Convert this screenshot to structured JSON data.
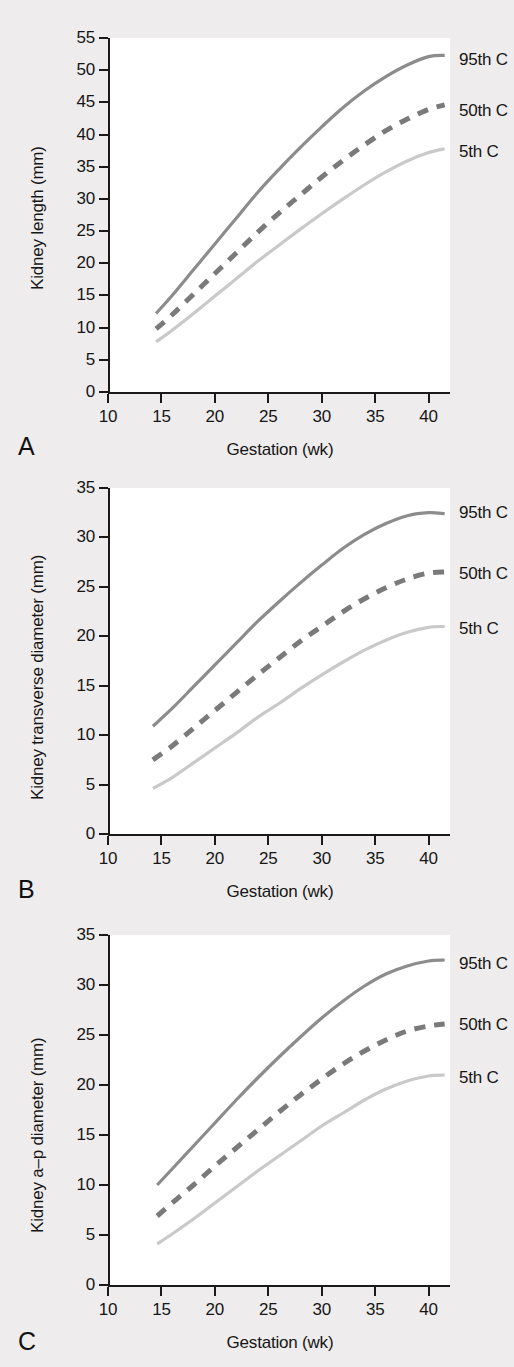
{
  "figure": {
    "background_color": "#eeecec",
    "plot_background_color": "#ffffff",
    "axis_color": "#1a1a1a"
  },
  "series_colors": {
    "p95": "#8c8c8c",
    "p50": "#7a7a7a",
    "p5": "#c9c9c9"
  },
  "legend": {
    "p95": "95th C",
    "p50": "50th C",
    "p5": "5th C"
  },
  "panels": [
    {
      "letter": "A",
      "ylabel": "Kidney length (mm)",
      "xlabel": "Gestation (wk)",
      "yticks": [
        "0",
        "5",
        "10",
        "15",
        "20",
        "25",
        "30",
        "35",
        "40",
        "45",
        "50",
        "55"
      ],
      "xticks": [
        "10",
        "15",
        "20",
        "25",
        "30",
        "35",
        "40"
      ]
    },
    {
      "letter": "B",
      "ylabel": "Kidney transverse diameter (mm)",
      "xlabel": "Gestation (wk)",
      "yticks": [
        "0",
        "5",
        "10",
        "15",
        "20",
        "25",
        "30",
        "35"
      ],
      "xticks": [
        "10",
        "15",
        "20",
        "25",
        "30",
        "35",
        "40"
      ]
    },
    {
      "letter": "C",
      "ylabel": "Kidney a–p diameter (mm)",
      "xlabel": "Gestation (wk)",
      "yticks": [
        "0",
        "5",
        "10",
        "15",
        "20",
        "25",
        "30",
        "35"
      ],
      "xticks": [
        "10",
        "15",
        "20",
        "25",
        "30",
        "35",
        "40"
      ]
    }
  ],
  "chart_data": [
    {
      "type": "line",
      "title": "",
      "panel": "A",
      "xlabel": "Gestation (wk)",
      "ylabel": "Kidney length (mm)",
      "xlim": [
        10,
        42
      ],
      "ylim": [
        0,
        55
      ],
      "xticks": [
        10,
        15,
        20,
        25,
        30,
        35,
        40
      ],
      "yticks": [
        0,
        5,
        10,
        15,
        20,
        25,
        30,
        35,
        40,
        45,
        50,
        55
      ],
      "grid": false,
      "legend_position": "right-outside",
      "x": [
        14.5,
        16,
        18,
        20,
        22,
        24,
        26,
        28,
        30,
        32,
        34,
        36,
        38,
        40,
        41.5
      ],
      "series": [
        {
          "name": "95th C",
          "style": "solid",
          "color": "#8c8c8c",
          "values": [
            12.2,
            15.0,
            19.0,
            23.0,
            27.0,
            31.0,
            34.6,
            38.0,
            41.2,
            44.2,
            46.8,
            49.0,
            50.8,
            52.1,
            52.3
          ]
        },
        {
          "name": "50th C",
          "style": "dashed",
          "color": "#7a7a7a",
          "values": [
            9.8,
            12.0,
            15.2,
            18.4,
            21.6,
            24.8,
            27.8,
            30.6,
            33.4,
            36.0,
            38.4,
            40.6,
            42.4,
            43.9,
            44.6
          ]
        },
        {
          "name": "5th C",
          "style": "solid",
          "color": "#c9c9c9",
          "values": [
            7.8,
            9.6,
            12.2,
            14.9,
            17.6,
            20.3,
            22.8,
            25.3,
            27.7,
            30.0,
            32.2,
            34.2,
            35.9,
            37.2,
            37.8
          ]
        }
      ]
    },
    {
      "type": "line",
      "title": "",
      "panel": "B",
      "xlabel": "Gestation (wk)",
      "ylabel": "Kidney transverse diameter (mm)",
      "xlim": [
        10,
        42
      ],
      "ylim": [
        0,
        35
      ],
      "xticks": [
        10,
        15,
        20,
        25,
        30,
        35,
        40
      ],
      "yticks": [
        0,
        5,
        10,
        15,
        20,
        25,
        30,
        35
      ],
      "grid": false,
      "legend_position": "right-outside",
      "x": [
        14.2,
        16,
        18,
        20,
        22,
        24,
        26,
        28,
        30,
        32,
        34,
        36,
        38,
        40,
        41.5
      ],
      "series": [
        {
          "name": "95th C",
          "style": "solid",
          "color": "#8c8c8c",
          "values": [
            10.9,
            12.7,
            14.9,
            17.1,
            19.3,
            21.5,
            23.5,
            25.4,
            27.2,
            28.9,
            30.3,
            31.4,
            32.2,
            32.5,
            32.4
          ]
        },
        {
          "name": "50th C",
          "style": "dashed",
          "color": "#7a7a7a",
          "values": [
            7.5,
            8.9,
            10.7,
            12.5,
            14.3,
            16.1,
            17.8,
            19.5,
            21.0,
            22.5,
            23.8,
            24.9,
            25.8,
            26.4,
            26.5
          ]
        },
        {
          "name": "5th C",
          "style": "solid",
          "color": "#c9c9c9",
          "values": [
            4.6,
            5.7,
            7.2,
            8.7,
            10.2,
            11.8,
            13.2,
            14.7,
            16.1,
            17.4,
            18.6,
            19.6,
            20.4,
            20.9,
            21.0
          ]
        }
      ]
    },
    {
      "type": "line",
      "title": "",
      "panel": "C",
      "xlabel": "Gestation (wk)",
      "ylabel": "Kidney a–p diameter (mm)",
      "xlim": [
        10,
        42
      ],
      "ylim": [
        0,
        35
      ],
      "xticks": [
        10,
        15,
        20,
        25,
        30,
        35,
        40
      ],
      "yticks": [
        0,
        5,
        10,
        15,
        20,
        25,
        30,
        35
      ],
      "grid": false,
      "legend_position": "right-outside",
      "x": [
        14.6,
        16,
        18,
        20,
        22,
        24,
        26,
        28,
        30,
        32,
        34,
        36,
        38,
        40,
        41.5
      ],
      "series": [
        {
          "name": "95th C",
          "style": "solid",
          "color": "#8c8c8c",
          "values": [
            10.0,
            11.6,
            13.9,
            16.2,
            18.5,
            20.7,
            22.8,
            24.8,
            26.7,
            28.4,
            29.9,
            31.1,
            31.9,
            32.4,
            32.5
          ]
        },
        {
          "name": "50th C",
          "style": "dashed",
          "color": "#7a7a7a",
          "values": [
            6.9,
            8.2,
            10.0,
            11.9,
            13.7,
            15.5,
            17.3,
            19.0,
            20.6,
            22.1,
            23.4,
            24.5,
            25.4,
            25.9,
            26.1
          ]
        },
        {
          "name": "5th C",
          "style": "solid",
          "color": "#c9c9c9",
          "values": [
            4.1,
            5.1,
            6.6,
            8.2,
            9.8,
            11.4,
            12.9,
            14.4,
            15.9,
            17.2,
            18.5,
            19.6,
            20.4,
            20.9,
            21.0
          ]
        }
      ]
    }
  ]
}
